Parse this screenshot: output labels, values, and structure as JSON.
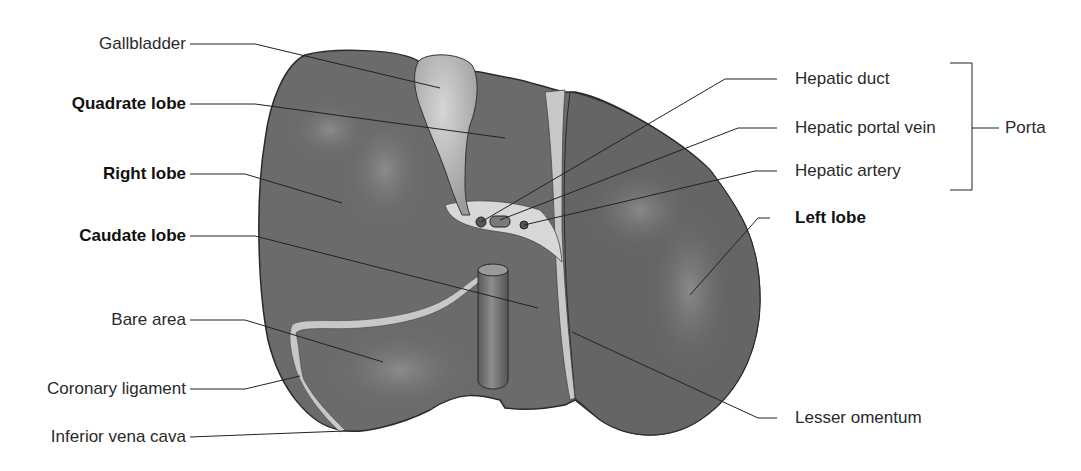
{
  "figure": {
    "colors": {
      "organ_fill": "#6b6b6b",
      "organ_dark": "#4f4f4f",
      "organ_outline": "#2a2a2a",
      "gallbladder_fill": "#b5b5b5",
      "ligament_fill": "#c8c8c8",
      "leader_line": "#222222",
      "background": "#ffffff"
    }
  },
  "labels": {
    "left": [
      {
        "text": "Gallbladder",
        "bold": false
      },
      {
        "text": "Quadrate lobe",
        "bold": true
      },
      {
        "text": "Right lobe",
        "bold": true
      },
      {
        "text": "Caudate lobe",
        "bold": true
      },
      {
        "text": "Bare area",
        "bold": false
      },
      {
        "text": "Coronary ligament",
        "bold": false
      },
      {
        "text": "Inferior vena cava",
        "bold": false
      }
    ],
    "right": [
      {
        "text": "Hepatic duct",
        "bold": false
      },
      {
        "text": "Hepatic portal vein",
        "bold": false
      },
      {
        "text": "Hepatic artery",
        "bold": false
      },
      {
        "text": "Left lobe",
        "bold": true
      },
      {
        "text": "Lesser omentum",
        "bold": false
      }
    ],
    "bracket": {
      "text": "Porta",
      "groups": [
        "Hepatic duct",
        "Hepatic portal vein",
        "Hepatic artery"
      ]
    }
  }
}
